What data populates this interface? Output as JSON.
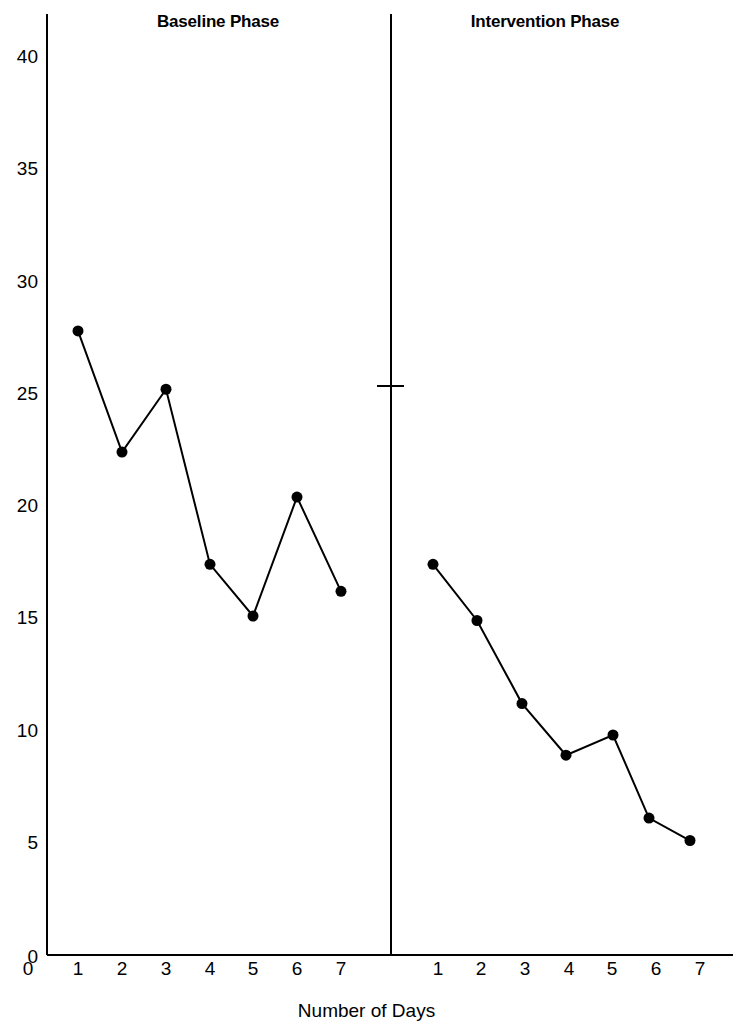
{
  "chart_data": {
    "type": "line",
    "title": "",
    "xlabel": "Number of Days",
    "ylabel": "",
    "xlim": [
      0,
      15.5
    ],
    "ylim": [
      0,
      40
    ],
    "grid": false,
    "legend": "none",
    "y_ticks": [
      0,
      5,
      10,
      15,
      20,
      25,
      30,
      35,
      40
    ],
    "y_tick_labels": [
      "0",
      "5",
      "10",
      "15",
      "20",
      "25",
      "30",
      "35",
      "40"
    ],
    "x_tick_labels": [
      "1",
      "2",
      "3",
      "4",
      "5",
      "6",
      "7",
      "1",
      "2",
      "3",
      "4",
      "5",
      "6",
      "7"
    ],
    "origin_label": "0",
    "phase_divider": {
      "label": "phase-divider",
      "x_value": 7.85,
      "tick_y_value": 25.4
    },
    "phases": [
      {
        "name": "Baseline Phase",
        "x": [
          1,
          2,
          3,
          4,
          5,
          6,
          7
        ],
        "values": [
          27.8,
          22.4,
          25.2,
          17.4,
          15.1,
          20.4,
          16.2
        ]
      },
      {
        "name": "Intervention Phase",
        "x": [
          1,
          2,
          3,
          4,
          5,
          6,
          7
        ],
        "values": [
          17.4,
          14.9,
          11.2,
          8.9,
          9.8,
          6.1,
          5.1
        ]
      }
    ],
    "series": [
      {
        "name": "Baseline Phase",
        "categories": [
          "1",
          "2",
          "3",
          "4",
          "5",
          "6",
          "7"
        ],
        "values": [
          27.8,
          22.4,
          25.2,
          17.4,
          15.1,
          20.4,
          16.2
        ]
      },
      {
        "name": "Intervention Phase",
        "categories": [
          "1",
          "2",
          "3",
          "4",
          "5",
          "6",
          "7"
        ],
        "values": [
          17.4,
          14.9,
          11.2,
          8.9,
          9.8,
          6.1,
          5.1
        ]
      }
    ],
    "marker": {
      "shape": "circle",
      "color": "#000000",
      "size_px": 11
    },
    "line": {
      "color": "#000000",
      "width_px": 2
    },
    "axis_color": "#000000"
  }
}
